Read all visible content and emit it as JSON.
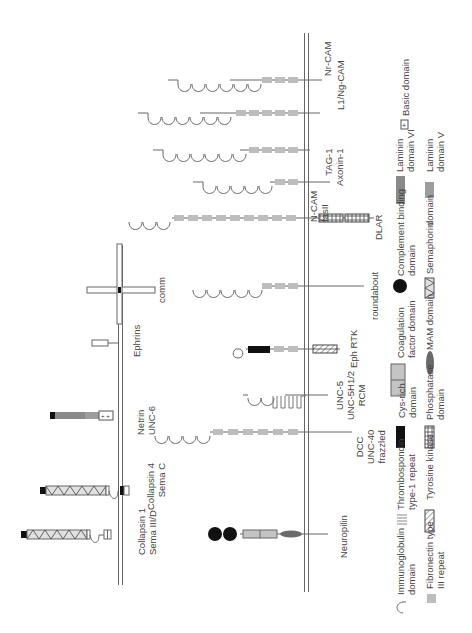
{
  "orientation": "rotated -90deg (text reads bottom-to-top)",
  "membranes": {
    "receptor_cell": "right vertical membrane",
    "ligand_cell": "left vertical membrane"
  },
  "receptors": [
    {
      "id": "nr-cam",
      "labels": [
        "Nr-CAM"
      ],
      "ig_domains": 6,
      "fn3_repeats": 3
    },
    {
      "id": "l1",
      "labels": [
        "L1/Ng-CAM"
      ],
      "ig_domains": 6,
      "fn3_repeats": 5
    },
    {
      "id": "axonin",
      "labels": [
        "TAG-1",
        "Axonin-1"
      ],
      "ig_domains": 6,
      "fn3_repeats": 4
    },
    {
      "id": "ncam",
      "labels": [
        "N-CAM",
        "fasII"
      ],
      "ig_domains": 5,
      "fn3_repeats": 2
    },
    {
      "id": "dlar",
      "labels": [
        "DLAR"
      ],
      "ig_domains": 3,
      "fn3_repeats": 9,
      "intracellular": "2 phosphatase domains"
    },
    {
      "id": "roundabout",
      "labels": [
        "roundabout"
      ],
      "ig_domains": 5,
      "fn3_repeats": 3
    },
    {
      "id": "eph",
      "labels": [
        "Eph RTK"
      ],
      "ig_domains": 1,
      "cys_rich": 1,
      "fn3_repeats": 2,
      "intracellular": "tyrosine kinase"
    },
    {
      "id": "unc5",
      "labels": [
        "UNC-5",
        "UNC-5H1/2",
        "RCM"
      ],
      "ig_domains": 2,
      "tsp1_repeats": 2
    },
    {
      "id": "dcc",
      "labels": [
        "DCC",
        "UNC-40",
        "frazzled"
      ],
      "ig_domains": 4,
      "fn3_repeats": 6
    },
    {
      "id": "neuropilin",
      "labels": [
        "Neuropilin"
      ],
      "complement_binding": 2,
      "coagulation_factor": 2,
      "mam": 1
    }
  ],
  "ligands": [
    {
      "id": "comm",
      "labels": [
        "comm"
      ],
      "type": "transmembrane"
    },
    {
      "id": "ephrins",
      "labels": [
        "Ephrins"
      ],
      "type": "membrane-anchored"
    },
    {
      "id": "netrin",
      "labels": [
        "Netrin",
        "UNC-6"
      ],
      "domains": [
        "laminin domain VI",
        "laminin domain V",
        "basic domain"
      ]
    },
    {
      "id": "collapsin4",
      "labels": [
        "Collapsin 4",
        "Sema C"
      ],
      "domains": [
        "cys-rich",
        "semaphorin",
        "immunoglobulin",
        "transmembrane"
      ]
    },
    {
      "id": "collapsin1",
      "labels": [
        "Collapsin 1",
        "Sema III/D"
      ],
      "domains": [
        "cys-rich",
        "semaphorin",
        "immunoglobulin",
        "basic"
      ]
    }
  ],
  "legend": [
    {
      "id": "ig",
      "label": [
        "Immunoglobulin",
        "domain"
      ]
    },
    {
      "id": "fn3",
      "label": [
        "Fibronectin type",
        "III repeat"
      ]
    },
    {
      "id": "tsp1",
      "label": [
        "Thrombospondin",
        "type-1 repeat"
      ]
    },
    {
      "id": "tk",
      "label": [
        "Tyrosine kinase"
      ]
    },
    {
      "id": "cys",
      "label": [
        "Cys-rich",
        "domain"
      ]
    },
    {
      "id": "ptp",
      "label": [
        "Phosphatase",
        "domain"
      ]
    },
    {
      "id": "coag",
      "label": [
        "Coagulation",
        "factor domain"
      ]
    },
    {
      "id": "mam",
      "label": [
        "MAM domain"
      ]
    },
    {
      "id": "comp",
      "label": [
        "Complement binding",
        "domain"
      ]
    },
    {
      "id": "sema",
      "label": [
        "Semaphorin",
        "domain"
      ]
    },
    {
      "id": "lam6",
      "label": [
        "Laminin",
        "domain VI"
      ]
    },
    {
      "id": "lam5",
      "label": [
        "Laminin",
        "domain V"
      ]
    },
    {
      "id": "basic",
      "label": [
        "Basic domain"
      ]
    }
  ],
  "colors": {
    "line": "#666666",
    "fn3": "#bdbdbd",
    "black": "#111111",
    "laminin6": "#8a8a8a",
    "laminin5": "#9c9c9c",
    "mam": "#6a6a6a"
  }
}
